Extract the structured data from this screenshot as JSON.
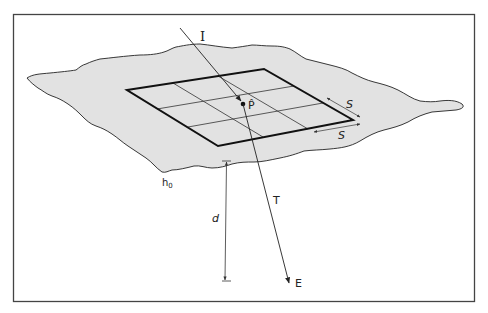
{
  "diagram": {
    "type": "geometric-optics-sketch",
    "labels": {
      "incident": "I",
      "point": "P̂",
      "transmitted": "T",
      "end": "E",
      "spacing_1": "S",
      "spacing_2": "S",
      "surface": "h",
      "surface_subscript": "0",
      "depth": "d"
    },
    "grid": {
      "rows": 3,
      "cols": 3
    },
    "colors": {
      "surface_fill": "#e2e2e2",
      "stroke": "#222222",
      "frame": "#444444",
      "background": "#ffffff"
    }
  }
}
